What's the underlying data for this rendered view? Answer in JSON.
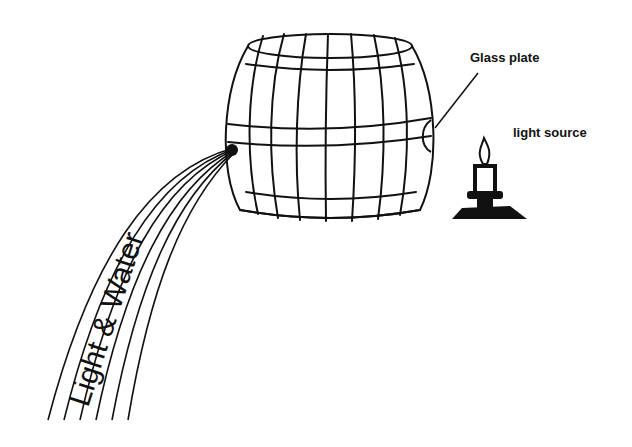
{
  "diagram": {
    "labels": {
      "glass_plate": "Glass plate",
      "light_source": "light source",
      "stream": "Light & Water"
    },
    "components": [
      "barrel",
      "glass-plate",
      "candle",
      "light-and-water-stream"
    ],
    "colors": {
      "ink": "#111111",
      "background": "#ffffff"
    }
  }
}
